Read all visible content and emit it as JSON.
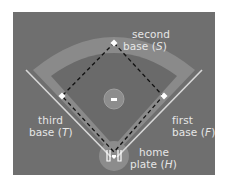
{
  "diagram": {
    "type": "baseball-diamond",
    "colors": {
      "field_background": "#6f6f6f",
      "infield_arc": "#8a8a8a",
      "diamond_fill": "#656565",
      "baselines": "#d8d8d8",
      "dashed_path": "#111111",
      "label_text": "#e6e6e6",
      "home_circle": "#8c8c8c",
      "pitcher_mound": "#8d8d8d"
    },
    "labels": {
      "second": {
        "line1": "second",
        "line2_prefix": "base (",
        "letter": "S",
        "line2_suffix": ")"
      },
      "third": {
        "line1": "third",
        "line2_prefix": "base (",
        "letter": "T",
        "line2_suffix": ")"
      },
      "first": {
        "line1": "first",
        "line2_prefix": "base (",
        "letter": "F",
        "line2_suffix": ")"
      },
      "home": {
        "line1": "home",
        "line2_prefix": "plate (",
        "letter": "H",
        "line2_suffix": ")"
      }
    }
  }
}
